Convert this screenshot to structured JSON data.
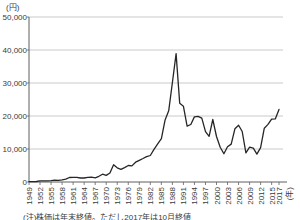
{
  "chart": {
    "y_axis_unit": "(円)",
    "x_axis_unit": "(年)",
    "note": "(注)株価は年末終値。ただし2017年は10月終値",
    "colors": {
      "line": "#262626",
      "grid": "#bcbcbc",
      "axis": "#5f5f5f",
      "text": "#3a3a3a"
    }
  },
  "chart_data": {
    "type": "line",
    "title": "",
    "xlabel": "(年)",
    "ylabel": "(円)",
    "ylim": [
      0,
      50000
    ],
    "grid": true,
    "legend": false,
    "y_gridlines": [
      10000,
      20000,
      30000,
      40000,
      50000
    ],
    "y_tick_labels": [
      "0",
      "10,000",
      "20,000",
      "30,000",
      "40,000",
      "50,000"
    ],
    "x_tick_years": [
      1949,
      1952,
      1955,
      1958,
      1961,
      1964,
      1967,
      1970,
      1973,
      1976,
      1979,
      1982,
      1985,
      1988,
      1991,
      1994,
      1997,
      2000,
      2003,
      2006,
      2009,
      2012,
      2015,
      2017
    ],
    "x": [
      1949,
      1950,
      1951,
      1952,
      1953,
      1954,
      1955,
      1956,
      1957,
      1958,
      1959,
      1960,
      1961,
      1962,
      1963,
      1964,
      1965,
      1966,
      1967,
      1968,
      1969,
      1970,
      1971,
      1972,
      1973,
      1974,
      1975,
      1976,
      1977,
      1978,
      1979,
      1980,
      1981,
      1982,
      1983,
      1984,
      1985,
      1986,
      1987,
      1988,
      1989,
      1990,
      1991,
      1992,
      1993,
      1994,
      1995,
      1996,
      1997,
      1998,
      1999,
      2000,
      2001,
      2002,
      2003,
      2004,
      2005,
      2006,
      2007,
      2008,
      2009,
      2010,
      2011,
      2012,
      2013,
      2014,
      2015,
      2016,
      2017
    ],
    "values": [
      110,
      102,
      166,
      362,
      377,
      356,
      425,
      549,
      475,
      666,
      875,
      1356,
      1433,
      1420,
      1225,
      1217,
      1417,
      1452,
      1283,
      1715,
      2359,
      1987,
      2714,
      5208,
      4307,
      3817,
      4359,
      4991,
      4866,
      6002,
      6569,
      7116,
      7682,
      8017,
      9894,
      11543,
      13113,
      18701,
      21564,
      30159,
      38916,
      23849,
      22984,
      16925,
      17417,
      19723,
      19868,
      19361,
      15259,
      13842,
      18934,
      13786,
      10543,
      8579,
      10677,
      11489,
      16111,
      17226,
      15308,
      8860,
      10546,
      10229,
      8455,
      10395,
      16291,
      17451,
      19034,
      19114,
      22012
    ]
  }
}
